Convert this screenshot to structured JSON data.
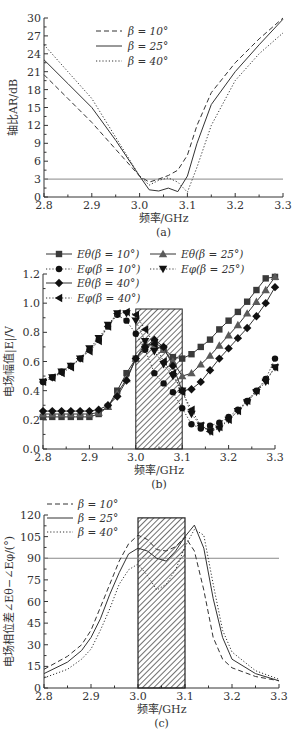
{
  "chart_data": [
    {
      "id": "a",
      "type": "line",
      "caption": "(a)",
      "title": "",
      "xlabel": "频率/GHz",
      "ylabel": "轴比AR/dB",
      "xlim": [
        2.8,
        3.3
      ],
      "ylim": [
        0,
        30
      ],
      "xticks": [
        "2.8",
        "2.9",
        "3.0",
        "3.1",
        "3.2",
        "3.3"
      ],
      "yticks": [
        "0",
        "3",
        "6",
        "9",
        "12",
        "15",
        "18",
        "21",
        "24",
        "27",
        "30"
      ],
      "grid": false,
      "legend_position": "upper center",
      "reference_line": {
        "y": 3,
        "label": "3 dB"
      },
      "series": [
        {
          "name": "β=10°",
          "style": "dashed",
          "x": [
            2.8,
            2.85,
            2.9,
            2.95,
            3.0,
            3.02,
            3.04,
            3.06,
            3.08,
            3.1,
            3.12,
            3.15,
            3.2,
            3.25,
            3.3
          ],
          "y": [
            20.5,
            16.5,
            12.5,
            8.0,
            3.5,
            2.5,
            3.0,
            3.6,
            4.5,
            7.0,
            12.0,
            17.5,
            22.5,
            26.5,
            30.0
          ]
        },
        {
          "name": "β=25°",
          "style": "solid",
          "x": [
            2.8,
            2.85,
            2.9,
            2.95,
            3.0,
            3.02,
            3.04,
            3.06,
            3.08,
            3.1,
            3.12,
            3.15,
            3.2,
            3.25,
            3.3
          ],
          "y": [
            23.0,
            19.0,
            15.0,
            9.5,
            3.5,
            1.2,
            1.0,
            1.5,
            0.9,
            3.5,
            9.0,
            15.5,
            21.0,
            25.5,
            29.8
          ]
        },
        {
          "name": "β=40°",
          "style": "dotted",
          "x": [
            2.8,
            2.85,
            2.9,
            2.95,
            3.0,
            3.02,
            3.04,
            3.06,
            3.08,
            3.1,
            3.12,
            3.15,
            3.2,
            3.25,
            3.3
          ],
          "y": [
            25.5,
            21.0,
            16.5,
            10.0,
            3.5,
            2.0,
            2.8,
            3.2,
            2.5,
            0.8,
            5.0,
            12.0,
            19.5,
            24.0,
            27.5
          ]
        }
      ]
    },
    {
      "id": "b",
      "type": "line",
      "caption": "(b)",
      "title": "",
      "xlabel": "频率/GHz",
      "ylabel": "电场幅值|E|/V",
      "xlim": [
        2.8,
        3.3
      ],
      "ylim": [
        0.0,
        1.2
      ],
      "xticks": [
        "2.8",
        "2.9",
        "3.0",
        "3.1",
        "3.2",
        "3.3"
      ],
      "yticks": [
        "0.0",
        "0.2",
        "0.4",
        "0.6",
        "0.8",
        "1.0",
        "1.2"
      ],
      "grid": false,
      "legend_position": "top",
      "shaded_band": {
        "x0": 3.0,
        "x1": 3.1,
        "y_top": 0.96,
        "pattern": "diagonal-hatch"
      },
      "x": [
        2.8,
        2.82,
        2.84,
        2.86,
        2.88,
        2.9,
        2.92,
        2.94,
        2.96,
        2.98,
        3.0,
        3.02,
        3.04,
        3.06,
        3.08,
        3.1,
        3.12,
        3.14,
        3.16,
        3.18,
        3.2,
        3.22,
        3.24,
        3.26,
        3.28,
        3.3
      ],
      "series": [
        {
          "name": "Eθ(β=10°)",
          "marker": "square",
          "style": "solid",
          "values": [
            0.22,
            0.22,
            0.22,
            0.22,
            0.22,
            0.22,
            0.24,
            0.29,
            0.4,
            0.52,
            0.62,
            0.7,
            0.73,
            0.69,
            0.63,
            0.62,
            0.65,
            0.7,
            0.75,
            0.82,
            0.88,
            0.94,
            1.01,
            1.09,
            1.17,
            1.18
          ]
        },
        {
          "name": "Eφ(β=10°)",
          "marker": "circle",
          "style": "dotted",
          "values": [
            0.46,
            0.49,
            0.53,
            0.57,
            0.62,
            0.68,
            0.75,
            0.84,
            0.92,
            0.88,
            0.79,
            0.68,
            0.52,
            0.45,
            0.39,
            0.28,
            0.17,
            0.14,
            0.16,
            0.18,
            0.22,
            0.27,
            0.33,
            0.4,
            0.48,
            0.62
          ]
        },
        {
          "name": "Eθ(β=25°)",
          "marker": "triangle-up",
          "style": "solid",
          "values": [
            0.24,
            0.24,
            0.24,
            0.24,
            0.24,
            0.24,
            0.25,
            0.29,
            0.38,
            0.48,
            0.62,
            0.72,
            0.71,
            0.68,
            0.6,
            0.5,
            0.52,
            0.58,
            0.64,
            0.71,
            0.78,
            0.85,
            0.93,
            1.01,
            1.09,
            1.18
          ]
        },
        {
          "name": "Eφ(β=25°)",
          "marker": "triangle-down",
          "style": "dotted",
          "values": [
            0.46,
            0.49,
            0.53,
            0.57,
            0.62,
            0.69,
            0.76,
            0.85,
            0.93,
            0.93,
            0.88,
            0.74,
            0.67,
            0.58,
            0.5,
            0.4,
            0.24,
            0.16,
            0.12,
            0.14,
            0.2,
            0.26,
            0.32,
            0.39,
            0.46,
            0.56
          ]
        },
        {
          "name": "Eθ(β=40°)",
          "marker": "diamond",
          "style": "solid",
          "values": [
            0.26,
            0.26,
            0.26,
            0.26,
            0.26,
            0.26,
            0.27,
            0.3,
            0.36,
            0.47,
            0.62,
            0.7,
            0.75,
            0.7,
            0.57,
            0.4,
            0.41,
            0.46,
            0.54,
            0.62,
            0.69,
            0.76,
            0.83,
            0.91,
            1.0,
            1.11
          ]
        },
        {
          "name": "Eφ(β=40°)",
          "marker": "triangle-left",
          "style": "dotted",
          "values": [
            0.46,
            0.49,
            0.52,
            0.56,
            0.62,
            0.67,
            0.74,
            0.84,
            0.93,
            0.94,
            0.92,
            0.82,
            0.72,
            0.6,
            0.52,
            0.39,
            0.27,
            0.16,
            0.12,
            0.15,
            0.2,
            0.26,
            0.33,
            0.4,
            0.47,
            0.56
          ]
        }
      ]
    },
    {
      "id": "c",
      "type": "line",
      "caption": "(c)",
      "title": "",
      "xlabel": "频率/GHz",
      "ylabel": "电场相位差∠Eθ−∠Eφ/(°)",
      "xlim": [
        2.8,
        3.3
      ],
      "ylim": [
        0,
        120
      ],
      "xticks": [
        "2.8",
        "2.9",
        "3.0",
        "3.1",
        "3.2",
        "3.3"
      ],
      "yticks": [
        "0",
        "15",
        "30",
        "45",
        "60",
        "75",
        "90",
        "105",
        "120"
      ],
      "grid": false,
      "legend_position": "upper left",
      "reference_line": {
        "y": 90,
        "label": "90°"
      },
      "shaded_band": {
        "x0": 3.0,
        "x1": 3.1,
        "y_top": 118,
        "pattern": "diagonal-hatch"
      },
      "series": [
        {
          "name": "β=10°",
          "style": "dashed",
          "x": [
            2.8,
            2.85,
            2.88,
            2.9,
            2.92,
            2.94,
            2.96,
            2.98,
            3.0,
            3.02,
            3.04,
            3.06,
            3.08,
            3.1,
            3.12,
            3.14,
            3.16,
            3.18,
            3.2,
            3.25,
            3.3
          ],
          "y": [
            13,
            22,
            30,
            40,
            56,
            72,
            88,
            100,
            106,
            103,
            96,
            95,
            98,
            105,
            95,
            68,
            35,
            20,
            14,
            8,
            5
          ]
        },
        {
          "name": "β=25°",
          "style": "solid",
          "x": [
            2.8,
            2.85,
            2.88,
            2.9,
            2.92,
            2.94,
            2.96,
            2.98,
            3.0,
            3.02,
            3.04,
            3.06,
            3.08,
            3.1,
            3.12,
            3.14,
            3.16,
            3.18,
            3.2,
            3.25,
            3.3
          ],
          "y": [
            10,
            18,
            26,
            35,
            48,
            65,
            80,
            93,
            97,
            95,
            90,
            88,
            95,
            105,
            113,
            97,
            62,
            35,
            20,
            10,
            5
          ]
        },
        {
          "name": "β=40°",
          "style": "dotted",
          "x": [
            2.8,
            2.85,
            2.88,
            2.9,
            2.92,
            2.94,
            2.96,
            2.98,
            3.0,
            3.02,
            3.04,
            3.06,
            3.08,
            3.1,
            3.12,
            3.14,
            3.16,
            3.18,
            3.2,
            3.25,
            3.3
          ],
          "y": [
            7,
            13,
            20,
            27,
            40,
            55,
            72,
            82,
            86,
            78,
            68,
            72,
            82,
            98,
            110,
            106,
            72,
            40,
            25,
            12,
            6
          ]
        }
      ]
    }
  ],
  "legend_a": [
    {
      "label": "β = 10°",
      "style": "dashed"
    },
    {
      "label": "β = 25°",
      "style": "solid"
    },
    {
      "label": "β = 40°",
      "style": "dotted"
    }
  ],
  "legend_b": [
    {
      "label": "Eθ(β = 10°)",
      "marker": "square",
      "style": "solid"
    },
    {
      "label": "Eφ(β = 10°)",
      "marker": "circle",
      "style": "dotted"
    },
    {
      "label": "Eθ(β = 40°)",
      "marker": "diamond",
      "style": "solid"
    },
    {
      "label": "Eφ(β = 40°)",
      "marker": "triangle-left",
      "style": "dotted"
    },
    {
      "label": "Eθ(β = 25°)",
      "marker": "triangle-up",
      "style": "solid"
    },
    {
      "label": "Eφ(β = 25°)",
      "marker": "triangle-down",
      "style": "dotted"
    }
  ],
  "legend_c": [
    {
      "label": "β = 10°",
      "style": "dashed"
    },
    {
      "label": "β = 25°",
      "style": "solid"
    },
    {
      "label": "β = 40°",
      "style": "dotted"
    }
  ],
  "colors": {
    "line": "#333333",
    "marker_square": "#3a3a3a",
    "marker_triangle_up": "#5a5a5a",
    "marker_other": "#111111",
    "reference_line": "#888888",
    "axis": "#333333"
  }
}
